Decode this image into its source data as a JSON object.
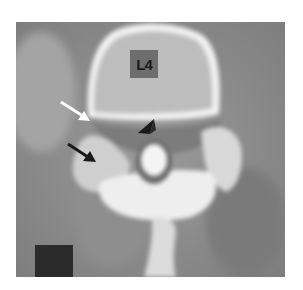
{
  "image": {
    "description": "Axial CT image of a lumbar vertebra with annotation arrows",
    "vertebra_label": "L4",
    "annotations": [
      {
        "type": "white-arrow",
        "direction": "down-right"
      },
      {
        "type": "black-arrow",
        "direction": "down-right"
      },
      {
        "type": "black-arrowhead",
        "direction": "down-left"
      }
    ],
    "colors": {
      "background": "#ffffff",
      "soft_tissue": "#8c8c8c",
      "bone": "#e6e6e6",
      "label_box": "#6e6e6e",
      "scale_box": "#2b2b2b"
    }
  }
}
